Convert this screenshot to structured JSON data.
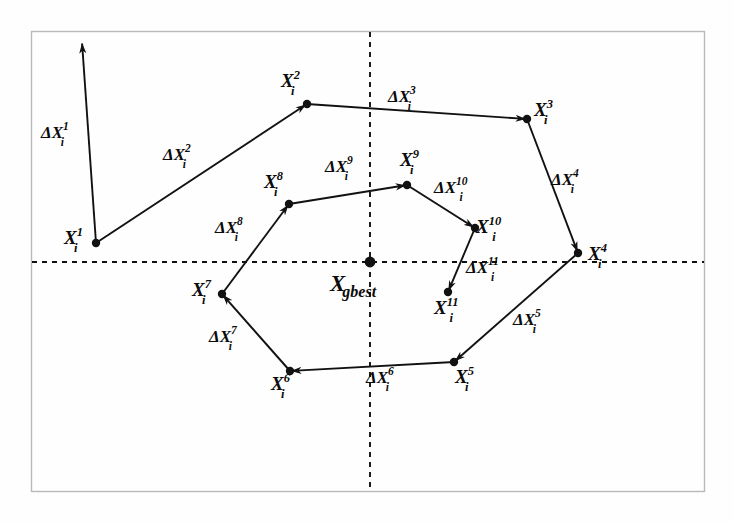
{
  "figure": {
    "type": "particle-swarm-trajectory-diagram",
    "background_color": "#fefefe",
    "line_color": "#111111",
    "border_color": "#b9b9b9",
    "axis_style": "dashed"
  },
  "axes": {
    "horizontal": {
      "y": 262,
      "x_start": 32,
      "x_end": 704,
      "style": "dashed"
    },
    "vertical": {
      "x": 370,
      "y_start": 32,
      "y_end": 491,
      "style": "dashed"
    }
  },
  "border": {
    "x": 31,
    "y": 31,
    "width": 674,
    "height": 461
  },
  "center": {
    "label_base": "X",
    "label_sub": "gbest",
    "full_label": "X gbest",
    "x": 370,
    "y": 262
  },
  "points": [
    {
      "id": "p1",
      "base": "X",
      "sub": "i",
      "sup": "1",
      "x": 96,
      "y": 243,
      "label_x": 64,
      "label_y": 228
    },
    {
      "id": "p2",
      "base": "X",
      "sub": "i",
      "sup": "2",
      "x": 307,
      "y": 104,
      "label_x": 281,
      "label_y": 71
    },
    {
      "id": "p3",
      "base": "X",
      "sub": "i",
      "sup": "3",
      "x": 527,
      "y": 119,
      "label_x": 534,
      "label_y": 100
    },
    {
      "id": "p4",
      "base": "X",
      "sub": "i",
      "sup": "4",
      "x": 578,
      "y": 253,
      "label_x": 588,
      "label_y": 244
    },
    {
      "id": "p5",
      "base": "X",
      "sub": "i",
      "sup": "5",
      "x": 454,
      "y": 362,
      "label_x": 455,
      "label_y": 367
    },
    {
      "id": "p6",
      "base": "X",
      "sub": "i",
      "sup": "6",
      "x": 290,
      "y": 371,
      "label_x": 271,
      "label_y": 374
    },
    {
      "id": "p7",
      "base": "X",
      "sub": "i",
      "sup": "7",
      "x": 222,
      "y": 294,
      "label_x": 192,
      "label_y": 280
    },
    {
      "id": "p8",
      "base": "X",
      "sub": "i",
      "sup": "8",
      "x": 289,
      "y": 204,
      "label_x": 264,
      "label_y": 172
    },
    {
      "id": "p9",
      "base": "X",
      "sub": "i",
      "sup": "9",
      "x": 407,
      "y": 185,
      "label_x": 400,
      "label_y": 150
    },
    {
      "id": "p10",
      "base": "X",
      "sub": "i",
      "sup": "10",
      "x": 475,
      "y": 228,
      "label_x": 476,
      "label_y": 217
    },
    {
      "id": "p11",
      "base": "X",
      "sub": "i",
      "sup": "11",
      "x": 448,
      "y": 292,
      "label_x": 434,
      "label_y": 298
    }
  ],
  "vectors": [
    {
      "id": "d1",
      "base": "ΔX",
      "sub": "i",
      "sup": "1",
      "from": "start",
      "to": "arrow-up",
      "x1": 96,
      "y1": 243,
      "x2": 82,
      "y2": 42,
      "label_x": 41,
      "label_y": 123
    },
    {
      "id": "d2",
      "base": "ΔX",
      "sub": "i",
      "sup": "2",
      "from": "p1",
      "to": "p2",
      "x1": 96,
      "y1": 243,
      "x2": 307,
      "y2": 104,
      "label_x": 163,
      "label_y": 145
    },
    {
      "id": "d3",
      "base": "ΔX",
      "sub": "i",
      "sup": "3",
      "from": "p2",
      "to": "p3",
      "x1": 307,
      "y1": 104,
      "x2": 527,
      "y2": 119,
      "label_x": 388,
      "label_y": 87
    },
    {
      "id": "d4",
      "base": "ΔX",
      "sub": "i",
      "sup": "4",
      "from": "p3",
      "to": "p4",
      "x1": 527,
      "y1": 119,
      "x2": 578,
      "y2": 253,
      "label_x": 551,
      "label_y": 170
    },
    {
      "id": "d5",
      "base": "ΔX",
      "sub": "i",
      "sup": "5",
      "from": "p4",
      "to": "p5",
      "x1": 578,
      "y1": 253,
      "x2": 454,
      "y2": 362,
      "label_x": 513,
      "label_y": 310
    },
    {
      "id": "d6",
      "base": "ΔX",
      "sub": "i",
      "sup": "6",
      "from": "p5",
      "to": "p6",
      "x1": 454,
      "y1": 362,
      "x2": 290,
      "y2": 371,
      "label_x": 366,
      "label_y": 368
    },
    {
      "id": "d7",
      "base": "ΔX",
      "sub": "i",
      "sup": "7",
      "from": "p6",
      "to": "p7",
      "x1": 290,
      "y1": 371,
      "x2": 222,
      "y2": 294,
      "label_x": 209,
      "label_y": 327
    },
    {
      "id": "d8",
      "base": "ΔX",
      "sub": "i",
      "sup": "8",
      "from": "p7",
      "to": "p8",
      "x1": 222,
      "y1": 294,
      "x2": 289,
      "y2": 204,
      "label_x": 215,
      "label_y": 218
    },
    {
      "id": "d9",
      "base": "ΔX",
      "sub": "i",
      "sup": "9",
      "from": "p8",
      "to": "p9",
      "x1": 289,
      "y1": 204,
      "x2": 407,
      "y2": 185,
      "label_x": 325,
      "label_y": 157
    },
    {
      "id": "d10",
      "base": "ΔX",
      "sub": "i",
      "sup": "10",
      "from": "p9",
      "to": "p10",
      "x1": 407,
      "y1": 185,
      "x2": 475,
      "y2": 228,
      "label_x": 434,
      "label_y": 178
    },
    {
      "id": "d11",
      "base": "ΔX",
      "sub": "i",
      "sup": "11",
      "from": "p10",
      "to": "p11",
      "x1": 475,
      "y1": 228,
      "x2": 448,
      "y2": 292,
      "label_x": 466,
      "label_y": 258
    }
  ]
}
